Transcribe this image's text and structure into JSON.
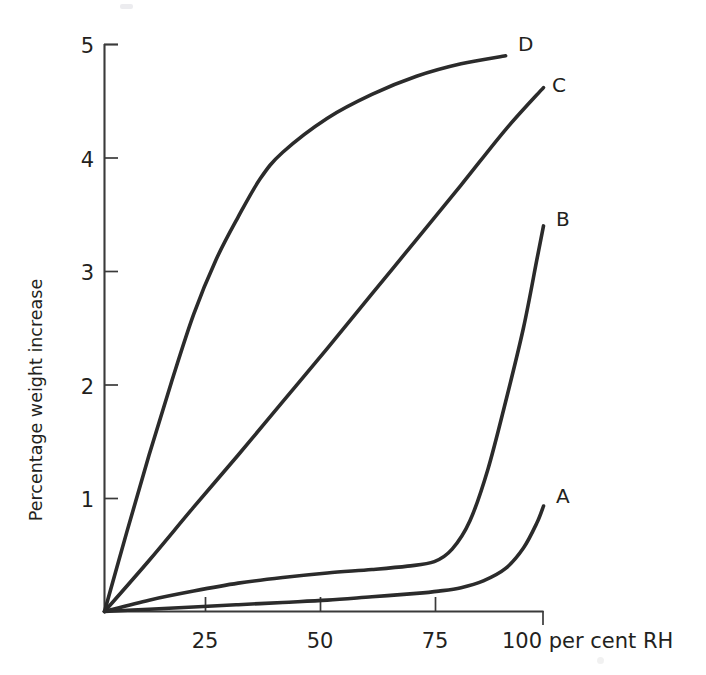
{
  "chart_data": {
    "type": "line",
    "title": "",
    "xlabel": "100 per cent RH",
    "ylabel": "Percentage weight increase",
    "xlim": [
      0,
      98.5
    ],
    "ylim": [
      0,
      5.0
    ],
    "grid": false,
    "legend_position": "curve-end-labels",
    "x_ticks": [
      {
        "value": 25,
        "label": "25"
      },
      {
        "value": 50,
        "label": "50"
      },
      {
        "value": 75,
        "label": "75"
      }
    ],
    "y_ticks": [
      {
        "value": 1,
        "label": "1"
      },
      {
        "value": 2,
        "label": "2"
      },
      {
        "value": 3,
        "label": "3"
      },
      {
        "value": 4,
        "label": "4"
      },
      {
        "value": 5,
        "label": "5"
      }
    ],
    "x_axis_end_label": "100 per cent RH",
    "series": [
      {
        "name": "A",
        "label": "A",
        "x": [
          0,
          10,
          20,
          30,
          40,
          50,
          60,
          70,
          75,
          80,
          85,
          90,
          94,
          97,
          98.5
        ],
        "values": [
          0.0,
          0.02,
          0.04,
          0.06,
          0.08,
          0.1,
          0.13,
          0.16,
          0.18,
          0.21,
          0.27,
          0.38,
          0.56,
          0.78,
          0.93
        ]
      },
      {
        "name": "B",
        "label": "B",
        "x": [
          0,
          10,
          20,
          30,
          40,
          50,
          60,
          68,
          74,
          78,
          82,
          86,
          90,
          94,
          97,
          98.5
        ],
        "values": [
          0.0,
          0.1,
          0.18,
          0.25,
          0.3,
          0.34,
          0.37,
          0.4,
          0.44,
          0.55,
          0.8,
          1.25,
          1.85,
          2.5,
          3.1,
          3.4
        ]
      },
      {
        "name": "C",
        "label": "C",
        "x": [
          0,
          10,
          20,
          30,
          40,
          50,
          60,
          70,
          80,
          90,
          98.5
        ],
        "values": [
          0.0,
          0.45,
          0.92,
          1.38,
          1.85,
          2.32,
          2.8,
          3.28,
          3.76,
          4.25,
          4.62
        ]
      },
      {
        "name": "D",
        "label": "D",
        "x": [
          0,
          5,
          10,
          15,
          20,
          25,
          30,
          35,
          40,
          50,
          60,
          70,
          80,
          90
        ],
        "values": [
          0.0,
          0.7,
          1.38,
          2.02,
          2.62,
          3.1,
          3.48,
          3.82,
          4.05,
          4.35,
          4.56,
          4.72,
          4.83,
          4.9
        ]
      }
    ],
    "series_labels": [
      {
        "name": "A",
        "label": "A"
      },
      {
        "name": "B",
        "label": "B"
      },
      {
        "name": "C",
        "label": "C"
      },
      {
        "name": "D",
        "label": "D"
      }
    ],
    "colors": {
      "curve": "#2b2b2b",
      "axis": "#3a3a3a",
      "text": "#231f20",
      "background": "#ffffff"
    }
  }
}
